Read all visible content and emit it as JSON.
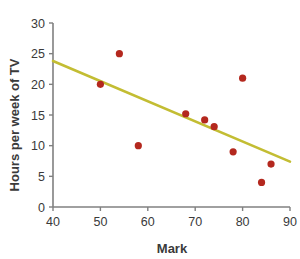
{
  "chart_data": {
    "type": "scatter",
    "title": "",
    "xlabel": "Mark",
    "ylabel": "Hours per week of TV",
    "xlim": [
      40,
      90
    ],
    "ylim": [
      0,
      30
    ],
    "xticks": [
      40,
      50,
      60,
      70,
      80,
      90
    ],
    "yticks": [
      0,
      5,
      10,
      15,
      20,
      25,
      30
    ],
    "grid": false,
    "legend": "none",
    "series": [
      {
        "name": "Students",
        "marker": "circle",
        "color": "#b4281e",
        "points": [
          {
            "x": 50,
            "y": 20
          },
          {
            "x": 54,
            "y": 25
          },
          {
            "x": 58,
            "y": 10
          },
          {
            "x": 68,
            "y": 15.2
          },
          {
            "x": 72,
            "y": 14.2
          },
          {
            "x": 74,
            "y": 13.1
          },
          {
            "x": 78,
            "y": 9
          },
          {
            "x": 80,
            "y": 21
          },
          {
            "x": 84,
            "y": 4
          },
          {
            "x": 86,
            "y": 7
          }
        ]
      }
    ],
    "trendline": {
      "name": "line of best fit",
      "color": "#c3bd33",
      "x_start": 40,
      "y_start": 23.8,
      "x_end": 90,
      "y_end": 7.4
    },
    "axis_color": "#808080",
    "background": "#ffffff"
  },
  "artifacts": {
    "top_ghost_text": ""
  }
}
